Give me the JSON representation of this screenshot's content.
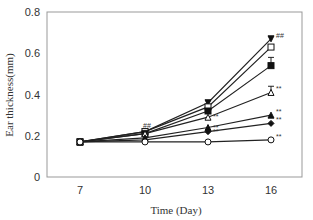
{
  "chart_data": {
    "type": "line",
    "title": "",
    "xlabel": "Time (Day)",
    "ylabel": "Ear thickness(mm)",
    "x": [
      7,
      10,
      13,
      16
    ],
    "x_tick_labels": [
      "7",
      "10",
      "13",
      "16"
    ],
    "ylim": [
      0,
      0.8
    ],
    "y_ticks": [
      0,
      0.2,
      0.4,
      0.6,
      0.8
    ],
    "y_tick_labels": [
      "0",
      "0.2",
      "0.4",
      "0.6",
      "0.8"
    ],
    "grid": false,
    "legend": "none",
    "series": [
      {
        "name": "filled-down-triangle",
        "marker": "tri-down-filled",
        "values": [
          0.17,
          0.22,
          0.36,
          0.67
        ],
        "annotation_end": "##",
        "annotation_day10": "##"
      },
      {
        "name": "open-square",
        "marker": "square-open",
        "values": [
          0.17,
          0.22,
          0.34,
          0.63
        ],
        "annotation_end": ""
      },
      {
        "name": "filled-square",
        "marker": "square-filled",
        "values": [
          0.17,
          0.21,
          0.32,
          0.54
        ],
        "annotation_end": "",
        "error_end": 0.04
      },
      {
        "name": "open-triangle",
        "marker": "tri-up-open",
        "values": [
          0.17,
          0.21,
          0.29,
          0.41
        ],
        "annotation_end": "**",
        "annotation_day13": "**",
        "error_end": 0.03
      },
      {
        "name": "filled-triangle",
        "marker": "tri-up-filled",
        "values": [
          0.17,
          0.19,
          0.24,
          0.3
        ],
        "annotation_end": "**",
        "annotation_day13": "**"
      },
      {
        "name": "filled-diamond",
        "marker": "diamond-filled",
        "values": [
          0.17,
          0.18,
          0.22,
          0.26
        ],
        "annotation_end": "**",
        "annotation_day13": "**"
      },
      {
        "name": "open-circle",
        "marker": "circle-open",
        "values": [
          0.17,
          0.17,
          0.17,
          0.18
        ],
        "annotation_end": "**"
      }
    ]
  }
}
